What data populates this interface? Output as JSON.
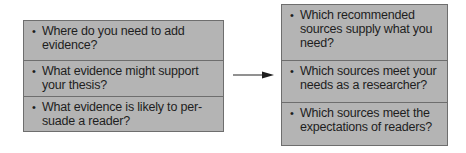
{
  "left_box": {
    "items": [
      {
        "text": "Where do you need to add evidence?"
      },
      {
        "text": "What evidence might support your thesis?"
      },
      {
        "text": "What evidence is likely to per-suade a reader?"
      }
    ]
  },
  "right_box": {
    "items": [
      {
        "text": "Which recommended sources supply what you need?"
      },
      {
        "text": "Which sources meet your needs as a researcher?"
      },
      {
        "text": "Which sources meet the expectations of readers?"
      }
    ]
  },
  "bullet": "•",
  "colors": {
    "box_fill": "#b4b4b4",
    "box_border": "#6e6e6e",
    "text": "#1e1e1e",
    "arrow": "#555555"
  }
}
